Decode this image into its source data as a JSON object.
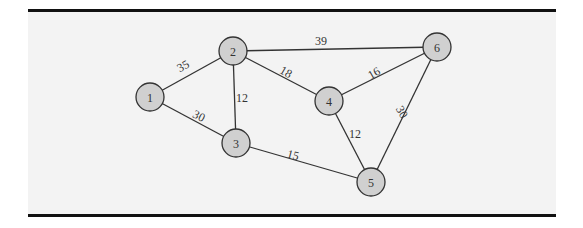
{
  "diagram": {
    "type": "weighted-undirected-graph",
    "background": "#f3f3f3",
    "node_fill": "#d0d0d0",
    "stroke": "#333333",
    "nodes": [
      {
        "id": "1",
        "label": "1",
        "x": 150,
        "y": 97
      },
      {
        "id": "2",
        "label": "2",
        "x": 233,
        "y": 51
      },
      {
        "id": "3",
        "label": "3",
        "x": 236,
        "y": 143
      },
      {
        "id": "4",
        "label": "4",
        "x": 329,
        "y": 101
      },
      {
        "id": "5",
        "label": "5",
        "x": 371,
        "y": 182
      },
      {
        "id": "6",
        "label": "6",
        "x": 437,
        "y": 47
      }
    ],
    "edges": [
      {
        "from": "1",
        "to": "2",
        "weight": "35",
        "lx": 183,
        "ly": 66,
        "rot": -29
      },
      {
        "from": "1",
        "to": "3",
        "weight": "30",
        "lx": 199,
        "ly": 116,
        "rot": 27
      },
      {
        "from": "2",
        "to": "3",
        "weight": "12",
        "lx": 242,
        "ly": 98,
        "rot": 0
      },
      {
        "from": "2",
        "to": "4",
        "weight": "18",
        "lx": 286,
        "ly": 72,
        "rot": 30
      },
      {
        "from": "2",
        "to": "6",
        "weight": "39",
        "lx": 321,
        "ly": 41,
        "rot": 0
      },
      {
        "from": "3",
        "to": "5",
        "weight": "15",
        "lx": 293,
        "ly": 155,
        "rot": 15
      },
      {
        "from": "4",
        "to": "5",
        "weight": "12",
        "lx": 355,
        "ly": 134,
        "rot": 0
      },
      {
        "from": "4",
        "to": "6",
        "weight": "16",
        "lx": 374,
        "ly": 73,
        "rot": -30
      },
      {
        "from": "5",
        "to": "6",
        "weight": "30",
        "lx": 402,
        "ly": 112,
        "rot": 60
      }
    ]
  }
}
